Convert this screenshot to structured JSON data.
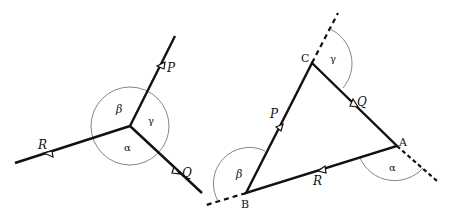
{
  "diagram": {
    "left_figure": {
      "forces": [
        {
          "label": "P",
          "direction": "outward-up"
        },
        {
          "label": "Q",
          "direction": "outward-down-right"
        },
        {
          "label": "R",
          "direction": "outward-left"
        }
      ],
      "angles": [
        {
          "label": "α",
          "between": "R-Q"
        },
        {
          "label": "β",
          "between": "R-P"
        },
        {
          "label": "γ",
          "between": "P-Q"
        }
      ]
    },
    "right_figure": {
      "vertices": [
        {
          "label": "A"
        },
        {
          "label": "B"
        },
        {
          "label": "C"
        }
      ],
      "sides": [
        {
          "label": "P",
          "from": "B",
          "to": "C"
        },
        {
          "label": "Q",
          "from": "C",
          "to": "A"
        },
        {
          "label": "R",
          "from": "A",
          "to": "B"
        }
      ],
      "exterior_angles": [
        {
          "label": "α",
          "at": "A"
        },
        {
          "label": "β",
          "at": "B"
        },
        {
          "label": "γ",
          "at": "C"
        }
      ]
    },
    "colors": {
      "line": "#111111",
      "arc": "#777777",
      "background": "#ffffff"
    }
  }
}
